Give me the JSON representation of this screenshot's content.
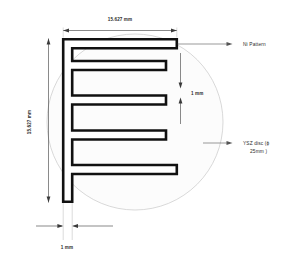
{
  "figure": {
    "background_color": "#ffffff"
  },
  "colors": {
    "pattern_stroke": "#111111",
    "pattern_fill": "#ffffff",
    "disc_stroke": "#c9c9c9",
    "disc_fill": "#fcfcfc",
    "dimension_line": "#3a3a3a",
    "extension_line": "#bdbdbd",
    "leader_line": "#555555",
    "text": "#2b2b2b"
  },
  "dimensions": {
    "width_label": "15.627 mm",
    "height_label": "15.627 mm",
    "finger_gap_label": "1 mm",
    "spine_width_label": "1 mm"
  },
  "callouts": {
    "ni_pattern": "Ni Pattern",
    "ysz_disc_line1": "YSZ disc  (ϕ",
    "ysz_disc_line2": "25mm )"
  },
  "geometry": {
    "disc_center_x": 135,
    "disc_center_y": 122,
    "disc_radius": 88,
    "pattern_left": 62,
    "pattern_right": 178,
    "pattern_top": 38,
    "pattern_bottom": 203,
    "trace_width": 9
  }
}
